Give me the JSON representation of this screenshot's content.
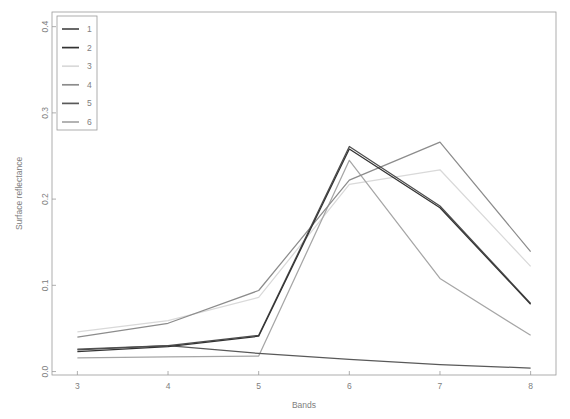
{
  "chart_data": {
    "type": "line",
    "title": "",
    "xlabel": "Bands",
    "ylabel": "Surface reflectance",
    "x": [
      3,
      4,
      5,
      6,
      7,
      8
    ],
    "xlim": [
      2.72,
      8.28
    ],
    "ylim": [
      -0.004,
      0.417
    ],
    "xticks": [
      "3",
      "4",
      "5",
      "6",
      "7",
      "8"
    ],
    "yticks": [
      "0.0",
      "0.1",
      "0.2",
      "0.3",
      "0.4"
    ],
    "ytickvals": [
      0.0,
      0.1,
      0.2,
      0.3,
      0.4
    ],
    "grid": false,
    "legend_position": "top-left",
    "legend_title": "",
    "series": [
      {
        "name": "1",
        "color": "#4d4d4d",
        "values": [
          0.025,
          0.03,
          0.042,
          0.261,
          0.192,
          0.079
        ]
      },
      {
        "name": "2",
        "color": "#333333",
        "values": [
          0.023,
          0.029,
          0.041,
          0.258,
          0.19,
          0.078
        ]
      },
      {
        "name": "3",
        "color": "#d9d9d9",
        "values": [
          0.046,
          0.059,
          0.086,
          0.217,
          0.234,
          0.122
        ]
      },
      {
        "name": "4",
        "color": "#8c8c8c",
        "values": [
          0.04,
          0.056,
          0.094,
          0.222,
          0.266,
          0.139
        ]
      },
      {
        "name": "5",
        "color": "#595959",
        "values": [
          0.026,
          0.03,
          0.021,
          0.014,
          0.008,
          0.004
        ]
      },
      {
        "name": "6",
        "color": "#a6a6a6",
        "values": [
          0.016,
          0.017,
          0.018,
          0.245,
          0.108,
          0.042
        ]
      }
    ]
  },
  "legend": {
    "entries": [
      {
        "label": "1"
      },
      {
        "label": "2"
      },
      {
        "label": "3"
      },
      {
        "label": "4"
      },
      {
        "label": "5"
      },
      {
        "label": "6"
      }
    ]
  }
}
